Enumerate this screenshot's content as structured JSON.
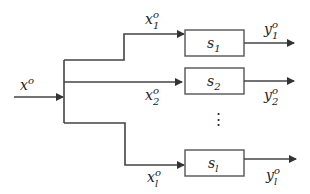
{
  "diagram": {
    "type": "block-diagram",
    "input": {
      "base": "x",
      "sup": "o"
    },
    "branches": [
      {
        "signal": {
          "base": "x",
          "sub": "1",
          "sup": "o"
        },
        "block": {
          "base": "s",
          "sub": "1"
        },
        "output": {
          "base": "y",
          "sub": "1",
          "sup": "o"
        }
      },
      {
        "signal": {
          "base": "x",
          "sub": "2",
          "sup": "o"
        },
        "block": {
          "base": "s",
          "sub": "2"
        },
        "output": {
          "base": "y",
          "sub": "2",
          "sup": "o"
        }
      },
      {
        "signal": {
          "base": "x",
          "sub": "l",
          "sup": "o"
        },
        "block": {
          "base": "s",
          "sub": "l"
        },
        "output": {
          "base": "y",
          "sub": "l",
          "sup": "o"
        }
      }
    ],
    "ellipsis": "⋮",
    "colors": {
      "line": "#444444",
      "box": "#555555",
      "text": "#222222"
    }
  }
}
